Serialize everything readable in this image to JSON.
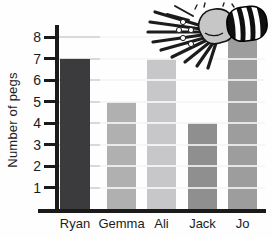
{
  "chart_data": {
    "type": "bar",
    "categories": [
      "Ryan",
      "Gemma",
      "Ali",
      "Jack",
      "Jo"
    ],
    "values": [
      7,
      5,
      7,
      4,
      8
    ],
    "title": "",
    "xlabel": "",
    "ylabel": "Number of pegs",
    "ylim": [
      0,
      8.6
    ],
    "yticks": [
      1,
      2,
      3,
      4,
      5,
      6,
      7,
      8
    ],
    "grid": true,
    "legend": false,
    "bar_colors": [
      "#3b3b3d",
      "#b0b0b0",
      "#c7c7ca",
      "#8f8f8f",
      "#9d9d9d"
    ]
  },
  "colors": {
    "axis": "#1a1a1a",
    "gridline": "#d9d9d9",
    "text": "#1c1c1c"
  },
  "icons": {
    "illustration": "hand-holding-pegs-illustration"
  }
}
